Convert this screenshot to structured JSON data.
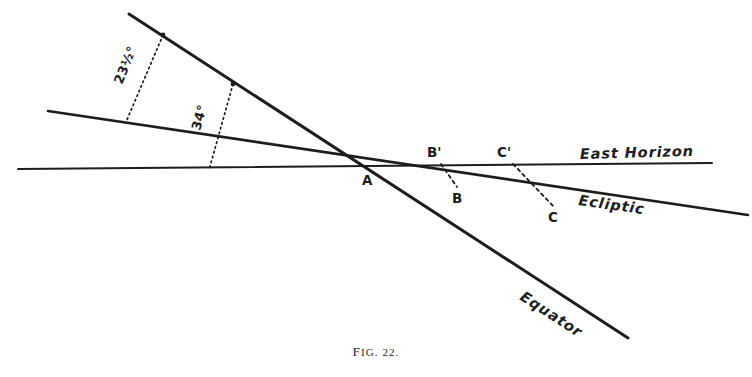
{
  "figure": {
    "caption_prefix": "F",
    "caption_rest": "IG. 22.",
    "caption_full": "FIG. 22.",
    "background_color": "#ffffff",
    "ink_color": "#1d1d1d"
  },
  "lines": [
    {
      "name": "east-horizon",
      "label": "East Horizon",
      "style": "solid",
      "x1": 18,
      "y1": 169,
      "x2": 712,
      "y2": 163,
      "label_x": 580,
      "label_y": 159,
      "label_rotation": -1.5
    },
    {
      "name": "ecliptic",
      "label": "Ecliptic",
      "style": "solid",
      "x1": 48,
      "y1": 111,
      "x2": 748,
      "y2": 215,
      "label_x": 578,
      "label_y": 205,
      "label_rotation": 8.0
    },
    {
      "name": "equator",
      "label": "Equator",
      "style": "solid",
      "x1": 129,
      "y1": 14,
      "x2": 628,
      "y2": 338,
      "label_x": 519,
      "label_y": 299,
      "label_rotation": 33.0
    }
  ],
  "intersection": {
    "name": "point-A",
    "label": "A",
    "x": 389,
    "y": 163,
    "label_x": 362,
    "label_y": 185
  },
  "angles": [
    {
      "name": "angle-23-half",
      "label": "23½°",
      "value": 23.5,
      "unit": "degrees",
      "between": [
        "equator",
        "ecliptic"
      ],
      "drop_from_x": 163,
      "drop_from_y": 35,
      "drop_to_x": 126,
      "drop_to_y": 122,
      "label_x": 122,
      "label_y": 85,
      "label_rotation": -68
    },
    {
      "name": "angle-34",
      "label": "34°",
      "value": 34,
      "unit": "degrees",
      "between": [
        "equator",
        "east-horizon"
      ],
      "drop_from_x": 233,
      "drop_from_y": 84,
      "drop_to_x": 209,
      "drop_to_y": 170,
      "label_x": 200,
      "label_y": 131,
      "label_rotation": -74
    }
  ],
  "points": [
    {
      "name": "point-B-prime",
      "label": "B'",
      "on_line": "east-horizon",
      "x": 441,
      "y": 163,
      "label_x": 427,
      "label_y": 157
    },
    {
      "name": "point-B",
      "label": "B",
      "on_line": "ecliptic",
      "x": 456,
      "y": 186,
      "label_x": 452,
      "label_y": 203
    },
    {
      "name": "point-C-prime",
      "label": "C'",
      "on_line": "east-horizon",
      "x": 512,
      "y": 163,
      "label_x": 497,
      "label_y": 157
    },
    {
      "name": "point-C",
      "label": "C",
      "on_line": "ecliptic",
      "x": 554,
      "y": 207,
      "label_x": 548,
      "label_y": 222
    }
  ],
  "connectors": [
    {
      "name": "connector-B-prime-to-B",
      "style": "dashed",
      "x1": 441,
      "y1": 164,
      "x2": 457,
      "y2": 187
    },
    {
      "name": "connector-C-prime-to-C",
      "style": "dashed",
      "x1": 513,
      "y1": 164,
      "x2": 555,
      "y2": 208
    }
  ]
}
